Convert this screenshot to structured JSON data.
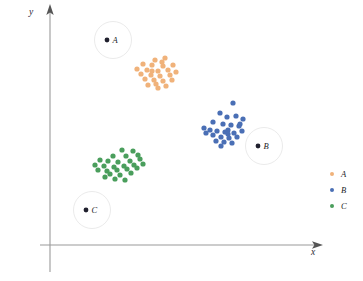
{
  "axes": {
    "x_label": "x",
    "y_label": "y",
    "axis_color": "#9a9a9a"
  },
  "legend": {
    "position": "right",
    "items": [
      {
        "label": "A",
        "color": "#f0b27a"
      },
      {
        "label": "B",
        "color": "#4a6fb5"
      },
      {
        "label": "C",
        "color": "#4a9e5c"
      }
    ]
  },
  "centroid_markers": [
    {
      "label": "A",
      "cx": 113,
      "cy": 40,
      "r": 18.5,
      "dot_color": "#20202e",
      "ring_color": "#ebebeb"
    },
    {
      "label": "B",
      "cx": 264,
      "cy": 146,
      "r": 18.5,
      "dot_color": "#20202e",
      "ring_color": "#ebebeb"
    },
    {
      "label": "C",
      "cx": 92,
      "cy": 210,
      "r": 18.5,
      "dot_color": "#20202e",
      "ring_color": "#ebebeb"
    }
  ],
  "chart_data": {
    "type": "scatter",
    "title": "",
    "xlabel": "x",
    "ylabel": "y",
    "grid": false,
    "legend_position": "right",
    "xlim": [
      0,
      363
    ],
    "ylim": [
      0,
      281
    ],
    "series": [
      {
        "name": "A",
        "color": "#f0b27a",
        "point_radius": 2.6,
        "centroid": {
          "x": 113,
          "y": 40
        },
        "points": [
          [
            155,
            60
          ],
          [
            165,
            58
          ],
          [
            143,
            64
          ],
          [
            152,
            65
          ],
          [
            163,
            66
          ],
          [
            137,
            69
          ],
          [
            147,
            70
          ],
          [
            158,
            71
          ],
          [
            168,
            70
          ],
          [
            173,
            65
          ],
          [
            141,
            74
          ],
          [
            151,
            75
          ],
          [
            160,
            76
          ],
          [
            170,
            75
          ],
          [
            176,
            72
          ],
          [
            145,
            79
          ],
          [
            154,
            80
          ],
          [
            163,
            81
          ],
          [
            172,
            80
          ],
          [
            156,
            84
          ],
          [
            148,
            85
          ],
          [
            166,
            86
          ],
          [
            158,
            88
          ],
          [
            152,
            71
          ],
          [
            162,
            62
          ]
        ]
      },
      {
        "name": "B",
        "color": "#4a6fb5",
        "point_radius": 2.6,
        "centroid": {
          "x": 264,
          "y": 146
        },
        "points": [
          [
            233,
            103
          ],
          [
            220,
            113
          ],
          [
            227,
            117
          ],
          [
            236,
            116
          ],
          [
            243,
            119
          ],
          [
            213,
            122
          ],
          [
            223,
            124
          ],
          [
            231,
            125
          ],
          [
            239,
            126
          ],
          [
            228,
            130
          ],
          [
            204,
            128
          ],
          [
            210,
            130
          ],
          [
            217,
            131
          ],
          [
            225,
            132
          ],
          [
            234,
            133
          ],
          [
            242,
            131
          ],
          [
            206,
            133
          ],
          [
            213,
            135
          ],
          [
            221,
            137
          ],
          [
            229,
            138
          ],
          [
            237,
            137
          ],
          [
            216,
            141
          ],
          [
            224,
            142
          ],
          [
            232,
            143
          ],
          [
            221,
            146
          ],
          [
            228,
            134
          ],
          [
            240,
            124
          ]
        ]
      },
      {
        "name": "C",
        "color": "#4a9e5c",
        "point_radius": 2.6,
        "centroid": {
          "x": 92,
          "y": 210
        },
        "points": [
          [
            122,
            150
          ],
          [
            133,
            151
          ],
          [
            113,
            156
          ],
          [
            126,
            156
          ],
          [
            138,
            155
          ],
          [
            100,
            160
          ],
          [
            108,
            161
          ],
          [
            118,
            162
          ],
          [
            130,
            161
          ],
          [
            140,
            159
          ],
          [
            95,
            165
          ],
          [
            104,
            166
          ],
          [
            114,
            167
          ],
          [
            124,
            166
          ],
          [
            134,
            165
          ],
          [
            143,
            164
          ],
          [
            98,
            170
          ],
          [
            107,
            171
          ],
          [
            117,
            170
          ],
          [
            127,
            169
          ],
          [
            137,
            168
          ],
          [
            110,
            174
          ],
          [
            120,
            175
          ],
          [
            131,
            173
          ],
          [
            115,
            179
          ],
          [
            125,
            180
          ],
          [
            105,
            177
          ]
        ]
      }
    ]
  }
}
